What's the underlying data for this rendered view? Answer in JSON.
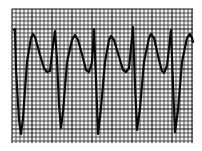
{
  "figure": {
    "background_color": "#ffffff",
    "grid": {
      "x0": 12,
      "y0": 9,
      "x1": 193,
      "y1": 143,
      "minor_spacing": 4,
      "major_every": 5,
      "minor_color": "#2a2a2a",
      "major_color": "#111111",
      "paper_color": "#f2f2f2"
    },
    "trace": {
      "color": "#0a0a0a",
      "points": [
        [
          14,
          30
        ],
        [
          15,
          29
        ],
        [
          16,
          70
        ],
        [
          19,
          120
        ],
        [
          21,
          134
        ],
        [
          23,
          118
        ],
        [
          27,
          62
        ],
        [
          31,
          38
        ],
        [
          33,
          34
        ],
        [
          35,
          37
        ],
        [
          40,
          55
        ],
        [
          44,
          68
        ],
        [
          47,
          72
        ],
        [
          50,
          71
        ],
        [
          53,
          45
        ],
        [
          55,
          31
        ],
        [
          57,
          60
        ],
        [
          59,
          105
        ],
        [
          61,
          128
        ],
        [
          63,
          112
        ],
        [
          67,
          62
        ],
        [
          72,
          40
        ],
        [
          75,
          35
        ],
        [
          78,
          40
        ],
        [
          83,
          58
        ],
        [
          86,
          70
        ],
        [
          89,
          72
        ],
        [
          92,
          62
        ],
        [
          94,
          29
        ],
        [
          96,
          80
        ],
        [
          98,
          134
        ],
        [
          101,
          108
        ],
        [
          105,
          62
        ],
        [
          109,
          40
        ],
        [
          111,
          36
        ],
        [
          114,
          40
        ],
        [
          120,
          60
        ],
        [
          123,
          70
        ],
        [
          126,
          72
        ],
        [
          129,
          68
        ],
        [
          133,
          27
        ],
        [
          135,
          85
        ],
        [
          137,
          130
        ],
        [
          140,
          108
        ],
        [
          144,
          62
        ],
        [
          149,
          38
        ],
        [
          151,
          34
        ],
        [
          154,
          38
        ],
        [
          159,
          60
        ],
        [
          162,
          71
        ],
        [
          164,
          73
        ],
        [
          167,
          66
        ],
        [
          171,
          30
        ],
        [
          173,
          85
        ],
        [
          175,
          132
        ],
        [
          178,
          110
        ],
        [
          182,
          62
        ],
        [
          187,
          38
        ],
        [
          190,
          34
        ],
        [
          192,
          38
        ],
        [
          193,
          42
        ]
      ]
    }
  }
}
